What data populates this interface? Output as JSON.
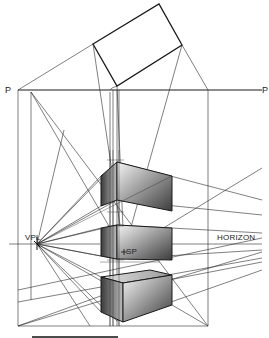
{
  "labels": {
    "p_left": "P",
    "p_right": "P",
    "vpl": "VPL",
    "sp": "SP",
    "horizon": "HORIZON"
  },
  "colors": {
    "line": "#1a1a1a",
    "thin_line": "#2a2a2a",
    "box_dark": "#3a3a3a",
    "box_light": "#f2f2f2"
  },
  "geometry": {
    "plan_rect": [
      [
        93,
        44
      ],
      [
        159,
        4
      ],
      [
        182,
        45
      ],
      [
        117,
        86
      ]
    ],
    "picture_plane": {
      "y": 90,
      "x1": 18,
      "x2": 262
    },
    "horizon_y": 243,
    "vpl": [
      37,
      244
    ],
    "sp": [
      124,
      252
    ],
    "verticals_x": [
      18,
      31,
      110,
      113,
      117,
      208
    ],
    "boxes": [
      {
        "name": "top",
        "front_top": [
          117,
          162
        ],
        "front_bottom": [
          117,
          200
        ],
        "left_top": [
          101,
          176
        ],
        "left_bottom": [
          101,
          206
        ],
        "right_top": [
          172,
          176
        ],
        "right_bottom": [
          172,
          211
        ]
      },
      {
        "name": "middle",
        "front_top": [
          117,
          225
        ],
        "front_bottom": [
          117,
          259
        ],
        "left_top": [
          101,
          228
        ],
        "left_bottom": [
          101,
          256
        ],
        "right_top": [
          172,
          228
        ],
        "right_bottom": [
          172,
          260
        ]
      },
      {
        "name": "bottom",
        "front_top": [
          117,
          290
        ],
        "front_bottom": [
          117,
          321
        ],
        "left_top": [
          101,
          277
        ],
        "left_bottom": [
          101,
          312
        ],
        "right_top": [
          172,
          275
        ],
        "right_bottom": [
          172,
          305
        ]
      }
    ],
    "scale_bar": {
      "x1": 32,
      "x2": 118,
      "y": 337
    }
  }
}
